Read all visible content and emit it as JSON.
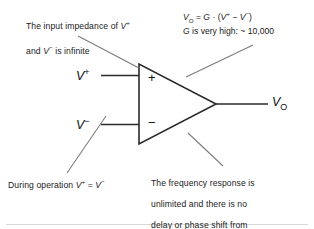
{
  "diagram": {
    "colors": {
      "ink": "#1a1a1a",
      "line": "#3a3a3a",
      "leader": "#6e6e6e",
      "background": "#ffffff"
    },
    "notes": {
      "input_impedance": {
        "line1_pre": "The input impedance of ",
        "line1_sym": "V",
        "line1_sup": "+",
        "line2_pre": "and ",
        "line2_sym": "V",
        "line2_sup": "−",
        "line2_post": " is infinite",
        "plain": "The input impedance of V+ and V− is infinite"
      },
      "during_operation": {
        "pre": "During operation ",
        "sym1": "V",
        "sup1": "+",
        "eq": " = ",
        "sym2": "V",
        "sup2": "−",
        "plain": "During operation V+ = V−"
      },
      "frequency_response": {
        "line1": "The frequency response is",
        "line2": "unlimited and there is no",
        "line3": "delay or phase shift from",
        "line4": "input to output",
        "plain": "The frequency response is unlimited and there is no delay or phase shift from input to output"
      }
    },
    "equation": {
      "line1": {
        "v": "V",
        "v_sub": "O",
        "equals": " = ",
        "gain": "G",
        "dot": " · ",
        "open": "(",
        "vp": "V",
        "vp_sup": "+",
        "minus": " − ",
        "vm": "V",
        "vm_sup": "−",
        "close": ")",
        "plain": "VO = G · (V+ − V−)"
      },
      "line2": {
        "gain": "G",
        "text": " is very high: ~ 10,000",
        "plain": "G is very high: ~ 10,000",
        "gain_value": "10,000",
        "approx": "~"
      }
    },
    "opamp": {
      "label": "operational-amplifier-triangle",
      "noninverting_input": {
        "sym": "V",
        "sup": "+",
        "plain": "V+"
      },
      "inverting_input": {
        "sym": "V",
        "sup": "−",
        "plain": "V−"
      },
      "output": {
        "sym": "V",
        "sub": "O",
        "plain": "VO"
      },
      "plus_sign": "+",
      "minus_sign": "−"
    }
  }
}
